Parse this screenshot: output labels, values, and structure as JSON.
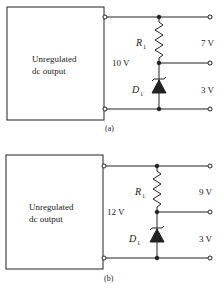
{
  "figures": [
    {
      "caption": "(a)",
      "box_label_line1": "Unregulated",
      "box_label_line2": "dc output",
      "input_voltage": "10 V",
      "resistor_label": "R",
      "resistor_subscript": "1",
      "diode_label": "D",
      "diode_subscript": "1",
      "upper_output": "7 V",
      "lower_output": "3 V"
    },
    {
      "caption": "(b)",
      "box_label_line1": "Unregulated",
      "box_label_line2": "dc output",
      "input_voltage": "12 V",
      "resistor_label": "R",
      "resistor_subscript": "1",
      "diode_label": "D",
      "diode_subscript": "1",
      "upper_output": "9 V",
      "lower_output": "3 V"
    }
  ],
  "colors": {
    "ink": "#222222",
    "background": "#ffffff"
  }
}
